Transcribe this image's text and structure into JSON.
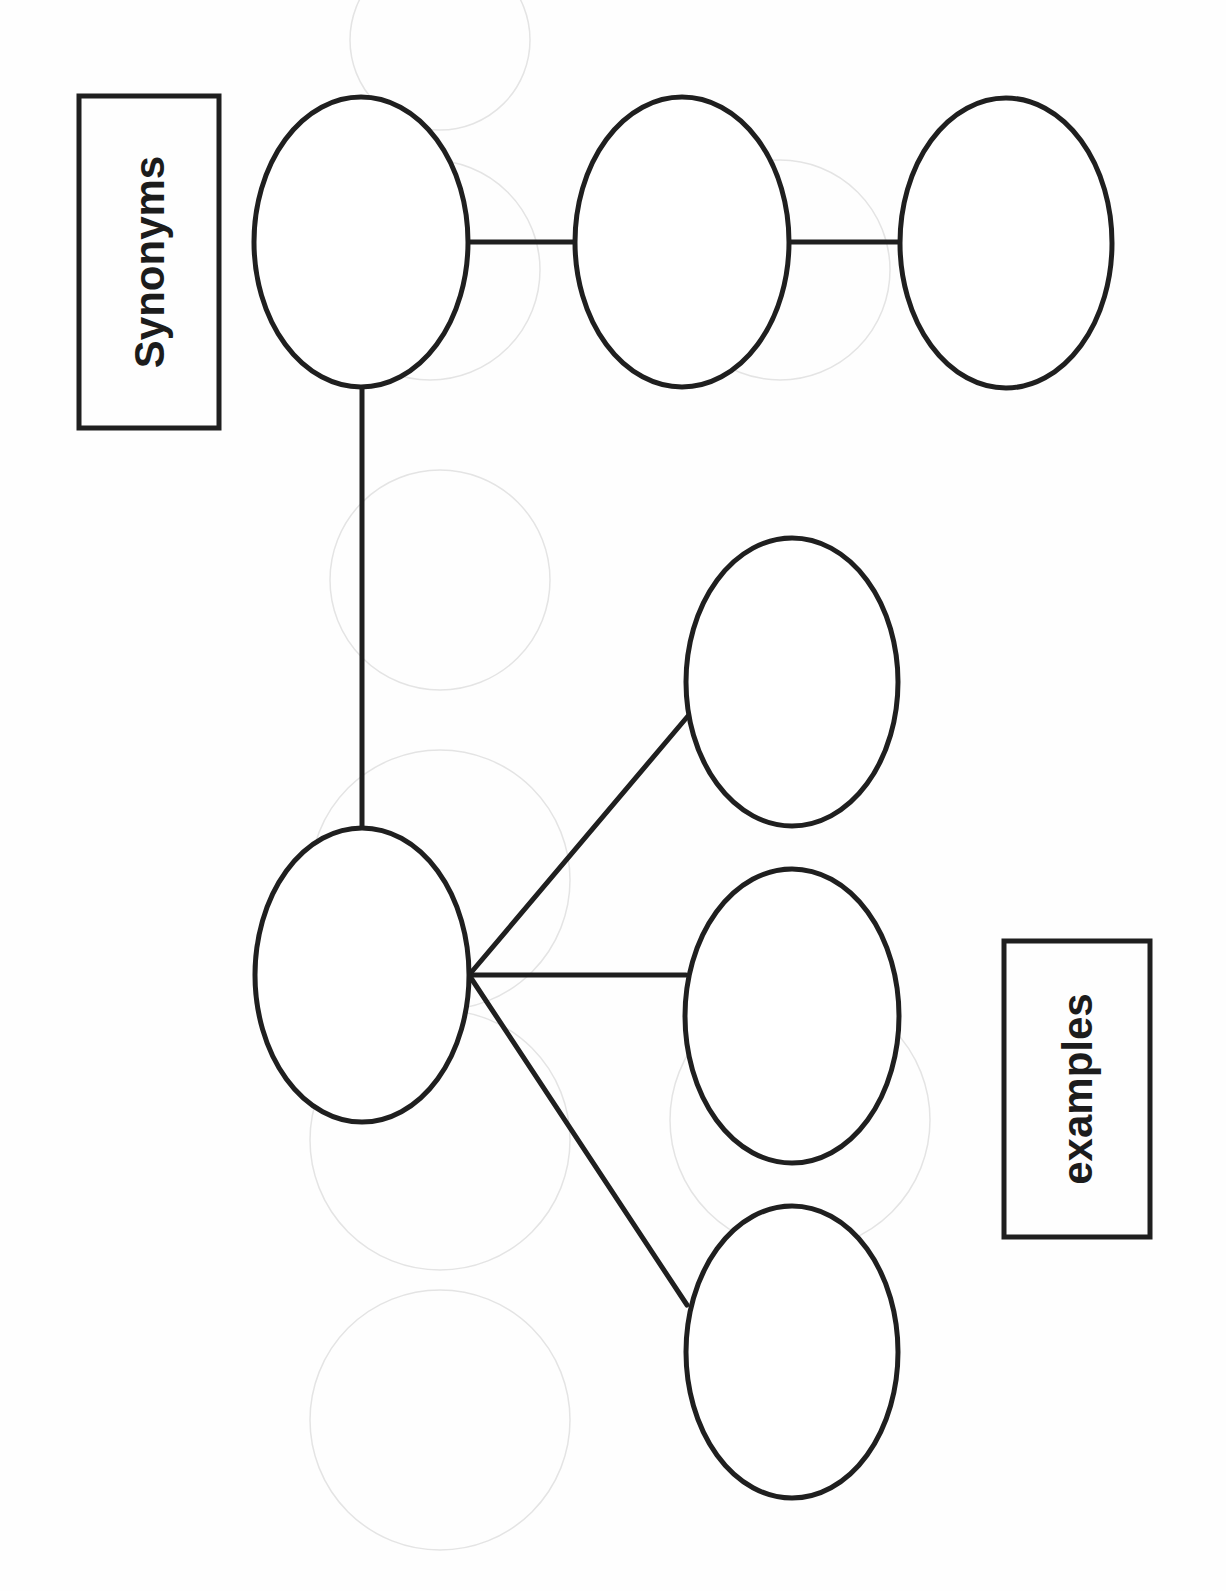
{
  "page": {
    "width": 1226,
    "height": 1591,
    "orientation": "rotated-90-ccw",
    "colors": {
      "ink": "#1f1f1f",
      "paper": "#fefefe",
      "ghost": "#e4e4e4"
    }
  },
  "labels": {
    "synonyms": {
      "text": "Synonyms",
      "box": {
        "x": 79,
        "y": 96,
        "w": 140,
        "h": 332
      },
      "cx": 149,
      "cy": 262,
      "font_size": 42
    },
    "examples": {
      "text": "examples",
      "box": {
        "x": 1004,
        "y": 941,
        "w": 146,
        "h": 296
      },
      "cx": 1077,
      "cy": 1089,
      "font_size": 42
    }
  },
  "nodes": [
    {
      "id": "synonym-root",
      "cx": 361,
      "cy": 242,
      "rx": 107,
      "ry": 145,
      "text": ""
    },
    {
      "id": "synonym-2",
      "cx": 682,
      "cy": 242,
      "rx": 107,
      "ry": 145,
      "text": ""
    },
    {
      "id": "synonym-3",
      "cx": 1006,
      "cy": 243,
      "rx": 106,
      "ry": 145,
      "text": ""
    },
    {
      "id": "example-root",
      "cx": 362,
      "cy": 975,
      "rx": 107,
      "ry": 147,
      "text": ""
    },
    {
      "id": "example-1",
      "cx": 792,
      "cy": 682,
      "rx": 106,
      "ry": 144,
      "text": ""
    },
    {
      "id": "example-2",
      "cx": 792,
      "cy": 1016,
      "rx": 107,
      "ry": 147,
      "text": ""
    },
    {
      "id": "example-3",
      "cx": 792,
      "cy": 1352,
      "rx": 106,
      "ry": 146,
      "text": ""
    }
  ],
  "edges": [
    {
      "from": "synonym-root",
      "to": "synonym-2",
      "x1": 468,
      "y1": 242,
      "x2": 575,
      "y2": 242
    },
    {
      "from": "synonym-2",
      "to": "synonym-3",
      "x1": 789,
      "y1": 242,
      "x2": 900,
      "y2": 242
    },
    {
      "from": "synonym-root",
      "to": "example-root",
      "x1": 362,
      "y1": 387,
      "x2": 362,
      "y2": 828
    },
    {
      "from": "example-root",
      "to": "example-1",
      "x1": 469,
      "y1": 975,
      "x2": 688,
      "y2": 716
    },
    {
      "from": "example-root",
      "to": "example-2",
      "x1": 469,
      "y1": 975,
      "x2": 686,
      "y2": 975
    },
    {
      "from": "example-root",
      "to": "example-3",
      "x1": 469,
      "y1": 975,
      "x2": 687,
      "y2": 1305
    }
  ],
  "ghost_circles": [
    {
      "cx": 430,
      "cy": 270,
      "r": 110
    },
    {
      "cx": 780,
      "cy": 270,
      "r": 110
    },
    {
      "cx": 440,
      "cy": 580,
      "r": 110
    },
    {
      "cx": 440,
      "cy": 880,
      "r": 130
    },
    {
      "cx": 440,
      "cy": 1140,
      "r": 130
    },
    {
      "cx": 440,
      "cy": 1420,
      "r": 130
    },
    {
      "cx": 800,
      "cy": 1120,
      "r": 130
    },
    {
      "cx": 440,
      "cy": 40,
      "r": 90
    }
  ]
}
